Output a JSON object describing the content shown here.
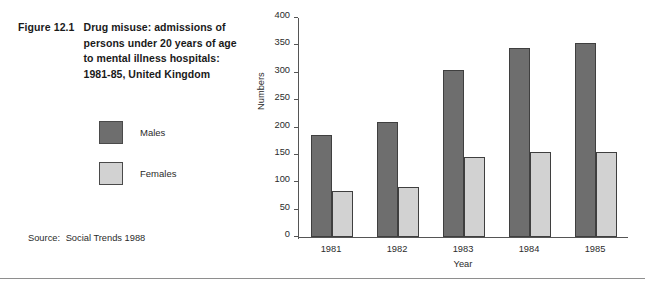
{
  "figure": {
    "number": "Figure 12.1",
    "title_lines": [
      "Drug misuse: admissions of",
      "persons under 20 years of age",
      "to mental illness hospitals:",
      "1981-85, United Kingdom"
    ]
  },
  "legend": {
    "items": [
      {
        "label": "Males",
        "color": "#6e6e6e"
      },
      {
        "label": "Females",
        "color": "#d2d2d2"
      }
    ]
  },
  "source": {
    "label": "Source:",
    "text": "Social Trends 1988"
  },
  "chart_data": {
    "type": "bar",
    "title": "Drug misuse: admissions of persons under 20 years of age to mental illness hospitals: 1981-85, United Kingdom",
    "xlabel": "Year",
    "ylabel": "Numbers",
    "categories": [
      "1981",
      "1982",
      "1983",
      "1984",
      "1985"
    ],
    "series": [
      {
        "name": "Males",
        "color": "#6e6e6e",
        "values": [
          186,
          210,
          305,
          345,
          355
        ]
      },
      {
        "name": "Females",
        "color": "#d2d2d2",
        "values": [
          84,
          92,
          147,
          155,
          156
        ]
      }
    ],
    "ylim": [
      0,
      400
    ],
    "yticks": [
      0,
      50,
      100,
      150,
      200,
      250,
      300,
      350,
      400
    ],
    "ytick_labels": [
      "0",
      "50",
      "100",
      "150",
      "200",
      "250",
      "300",
      "350",
      "400"
    ],
    "grid": false,
    "legend_position": "left-outside"
  }
}
